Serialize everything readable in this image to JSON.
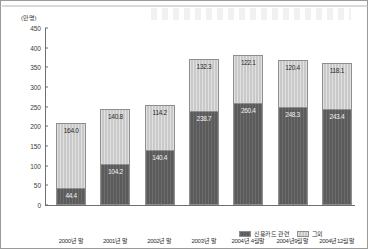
{
  "chart_data": {
    "type": "bar",
    "stacked": true,
    "title": "",
    "unit_label": "(만명)",
    "xlabel": "",
    "ylabel": "",
    "ylim": [
      0,
      450
    ],
    "ytick_step": 50,
    "yticks": [
      "0",
      "50",
      "100",
      "150",
      "200",
      "250",
      "300",
      "350",
      "400",
      "450"
    ],
    "grid": false,
    "legend_position": "bottom-right",
    "categories": [
      "2000년 말",
      "2001년 말",
      "2002년 말",
      "2003년 말",
      "2004년 4월말",
      "2004년9월말",
      "2004년12월말"
    ],
    "series": [
      {
        "name": "신용카드 관련",
        "color": "#5b5b5b",
        "values": [
          44.4,
          104.2,
          140.4,
          238.7,
          260.4,
          248.3,
          243.4
        ]
      },
      {
        "name": "그외",
        "color": "#c9c9c9",
        "values": [
          164.0,
          140.8,
          114.2,
          132.3,
          122.1,
          120.4,
          118.1
        ]
      }
    ],
    "totals": [
      208.4,
      245.0,
      254.6,
      371.0,
      382.5,
      368.7,
      361.5
    ]
  },
  "legend": {
    "items": [
      {
        "label": "신용카드 관련",
        "swatch": "sw-dark"
      },
      {
        "label": "그외",
        "swatch": "sw-light"
      }
    ]
  }
}
